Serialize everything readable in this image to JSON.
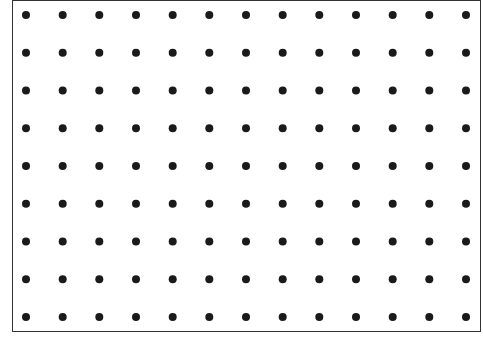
{
  "figure": {
    "type": "dot-grid",
    "columns": 13,
    "rows": 9,
    "dot_color": "#1a1a1a",
    "border_color": "#333333",
    "background": "#ffffff"
  }
}
